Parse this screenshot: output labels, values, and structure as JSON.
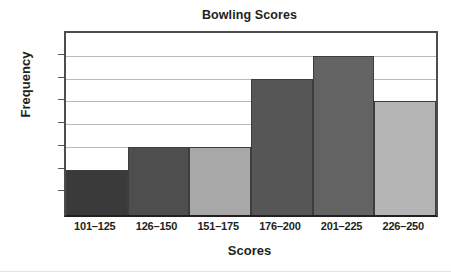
{
  "chart_data": {
    "type": "bar",
    "title": "Bowling Scores",
    "xlabel": "Scores",
    "ylabel": "Frequency",
    "categories": [
      "101–125",
      "126–150",
      "151–175",
      "176–200",
      "201–225",
      "226–250"
    ],
    "values": [
      2,
      3,
      3,
      6,
      7,
      5
    ],
    "ylim": [
      0,
      8
    ],
    "yticks": [
      0,
      1,
      2,
      3,
      4,
      5,
      6,
      7,
      8
    ],
    "ytick_labels": [
      "0",
      "1",
      "2",
      "3",
      "4",
      "5",
      "6",
      "7",
      "8"
    ],
    "grid": true,
    "grid_axis": "y",
    "legend": false,
    "bar_colors": [
      "#3a3a3a",
      "#4e4e4e",
      "#a8a8a8",
      "#565656",
      "#636363",
      "#b5b5b5"
    ],
    "bar_edge_color": "#3d3d3d",
    "axis_color": "#231f20",
    "gridline_color": "#b9b9b9",
    "background": "#ffffff",
    "bars_contiguous": true
  }
}
